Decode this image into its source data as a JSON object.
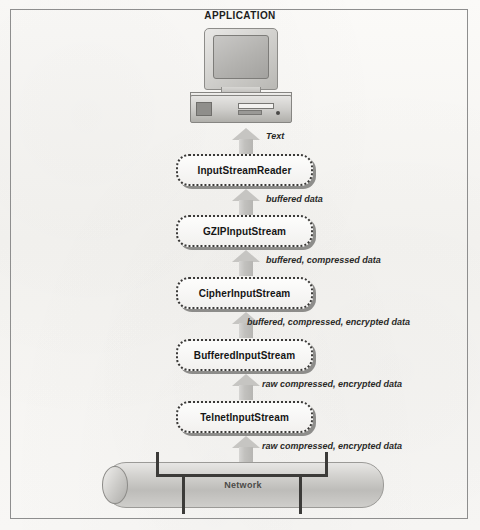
{
  "diagram": {
    "title": "APPLICATION",
    "endpoint_icon": "desktop-computer-icon",
    "network": {
      "label": "Network",
      "shape": "cable-cylinder"
    },
    "streams": [
      {
        "label": "InputStreamReader"
      },
      {
        "label": "GZIPInputStream"
      },
      {
        "label": "CipherInputStream"
      },
      {
        "label": "BufferedInputStream"
      },
      {
        "label": "TelnetInputStream"
      }
    ],
    "flows": [
      {
        "label": "Text"
      },
      {
        "label": "buffered data"
      },
      {
        "label": "buffered, compressed data"
      },
      {
        "label": "buffered, compressed, encrypted data"
      },
      {
        "label": "raw compressed, encrypted data"
      },
      {
        "label": "raw compressed, encrypted data"
      }
    ]
  }
}
